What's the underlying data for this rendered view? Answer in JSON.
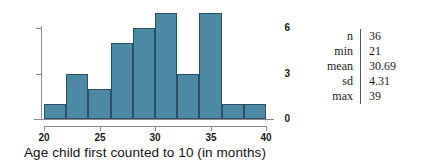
{
  "chart_data": {
    "type": "bar",
    "title": "",
    "xlabel": "Age child first counted to 10 (in months)",
    "ylabel": "",
    "xlim": [
      20,
      40
    ],
    "ylim": [
      0,
      7
    ],
    "grid": false,
    "legend": "none",
    "bin_width": 2,
    "bin_edges": [
      20,
      22,
      24,
      26,
      28,
      30,
      32,
      34,
      36,
      38,
      40
    ],
    "categories": [
      "20-22",
      "22-24",
      "24-26",
      "26-28",
      "28-30",
      "30-32",
      "32-34",
      "34-36",
      "36-38",
      "38-40"
    ],
    "values": [
      1,
      3,
      2,
      5,
      6,
      7,
      3,
      7,
      1,
      1
    ],
    "xticks": [
      20,
      25,
      30,
      35,
      40
    ],
    "xtick_labels": [
      "20",
      "25",
      "30",
      "35",
      "40"
    ],
    "yticks": [
      0,
      3,
      6
    ],
    "ytick_labels": [
      "0",
      "3",
      "6"
    ],
    "bar_color": "#4c89a4",
    "bar_edge_color": "#2d4f63",
    "axis_color": "#8a8a8a"
  },
  "stats": {
    "rows": [
      {
        "label": "n",
        "value": "36"
      },
      {
        "label": "min",
        "value": "21"
      },
      {
        "label": "mean",
        "value": "30.69"
      },
      {
        "label": "sd",
        "value": "4.31"
      },
      {
        "label": "max",
        "value": "39"
      }
    ]
  }
}
